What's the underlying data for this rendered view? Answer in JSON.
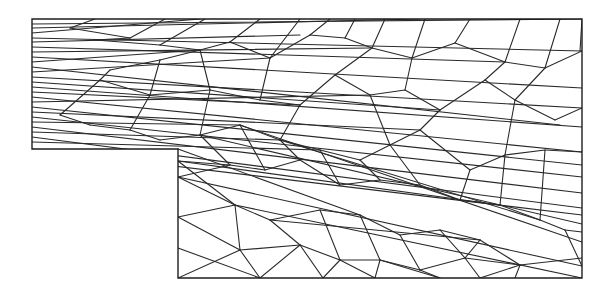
{
  "figure": {
    "title": "Triangular finite element mesh of L-shaped (step) domain",
    "stroke_color": "#2a2a2a",
    "background": "#ffffff"
  },
  "domain_boundary": {
    "points": [
      [
        32,
        19
      ],
      [
        582,
        19
      ],
      [
        582,
        278
      ],
      [
        178,
        278
      ],
      [
        178,
        149
      ],
      [
        32,
        149
      ]
    ]
  },
  "mesh": {
    "nodes_left_edge_y": [
      19,
      24,
      28,
      33,
      38,
      42,
      47,
      52,
      57,
      62,
      67,
      72,
      77,
      82,
      87,
      92,
      97,
      102,
      107,
      112,
      117,
      122,
      127,
      132,
      137,
      142,
      149
    ],
    "nodes_right_edge_y": [
      19,
      51,
      88,
      108,
      127,
      152,
      165,
      177,
      185,
      193,
      200,
      208,
      215,
      224,
      232,
      242,
      258,
      266,
      278
    ],
    "nodes_step_edge_y": [
      149,
      161,
      177,
      217,
      248,
      278
    ],
    "nodes_top_edge_x": [
      32,
      95,
      165,
      205,
      260,
      300,
      330,
      355,
      385,
      425,
      470,
      520,
      560,
      582
    ],
    "nodes_bottom_edge_x": [
      178,
      260,
      323,
      375,
      440,
      480,
      515,
      582
    ],
    "interior_nodes": [
      [
        70,
        28
      ],
      [
        95,
        40
      ],
      [
        130,
        38
      ],
      [
        160,
        45
      ],
      [
        110,
        70
      ],
      [
        160,
        60
      ],
      [
        200,
        50
      ],
      [
        230,
        42
      ],
      [
        270,
        58
      ],
      [
        310,
        35
      ],
      [
        345,
        38
      ],
      [
        372,
        48
      ],
      [
        412,
        58
      ],
      [
        455,
        43
      ],
      [
        505,
        62
      ],
      [
        545,
        68
      ],
      [
        100,
        80
      ],
      [
        150,
        95
      ],
      [
        210,
        90
      ],
      [
        260,
        100
      ],
      [
        300,
        105
      ],
      [
        335,
        75
      ],
      [
        370,
        95
      ],
      [
        405,
        90
      ],
      [
        440,
        110
      ],
      [
        485,
        80
      ],
      [
        515,
        100
      ],
      [
        555,
        120
      ],
      [
        60,
        115
      ],
      [
        90,
        125
      ],
      [
        130,
        130
      ],
      [
        160,
        140
      ],
      [
        200,
        135
      ],
      [
        240,
        125
      ],
      [
        280,
        140
      ],
      [
        320,
        150
      ],
      [
        360,
        160
      ],
      [
        390,
        145
      ],
      [
        420,
        130
      ],
      [
        470,
        170
      ],
      [
        505,
        155
      ],
      [
        545,
        150
      ],
      [
        230,
        165
      ],
      [
        265,
        170
      ],
      [
        300,
        160
      ],
      [
        340,
        185
      ],
      [
        380,
        180
      ],
      [
        420,
        185
      ],
      [
        460,
        200
      ],
      [
        500,
        205
      ],
      [
        540,
        220
      ],
      [
        565,
        230
      ],
      [
        235,
        205
      ],
      [
        270,
        220
      ],
      [
        320,
        210
      ],
      [
        360,
        215
      ],
      [
        400,
        235
      ],
      [
        440,
        230
      ],
      [
        480,
        240
      ],
      [
        520,
        265
      ],
      [
        240,
        250
      ],
      [
        300,
        245
      ],
      [
        340,
        260
      ],
      [
        380,
        260
      ],
      [
        420,
        270
      ],
      [
        465,
        258
      ]
    ],
    "edges": [
      [
        32,
        24,
        582,
        19
      ],
      [
        32,
        28,
        420,
        19
      ],
      [
        32,
        33,
        200,
        19
      ],
      [
        32,
        38,
        582,
        51
      ],
      [
        32,
        42,
        300,
        35
      ],
      [
        32,
        47,
        505,
        62
      ],
      [
        32,
        52,
        370,
        48
      ],
      [
        32,
        57,
        582,
        88
      ],
      [
        32,
        62,
        200,
        50
      ],
      [
        32,
        67,
        560,
        125
      ],
      [
        32,
        72,
        270,
        58
      ],
      [
        32,
        77,
        582,
        108
      ],
      [
        32,
        82,
        440,
        110
      ],
      [
        32,
        87,
        582,
        127
      ],
      [
        32,
        92,
        300,
        105
      ],
      [
        32,
        97,
        582,
        152
      ],
      [
        32,
        102,
        370,
        95
      ],
      [
        32,
        107,
        582,
        165
      ],
      [
        32,
        112,
        420,
        130
      ],
      [
        32,
        117,
        582,
        177
      ],
      [
        32,
        122,
        240,
        125
      ],
      [
        32,
        127,
        582,
        193
      ],
      [
        32,
        132,
        280,
        140
      ],
      [
        32,
        137,
        582,
        208
      ],
      [
        32,
        142,
        320,
        150
      ],
      [
        32,
        149,
        582,
        215
      ],
      [
        95,
        19,
        70,
        28
      ],
      [
        70,
        28,
        130,
        38
      ],
      [
        130,
        38,
        165,
        19
      ],
      [
        130,
        38,
        95,
        40
      ],
      [
        95,
        40,
        160,
        45
      ],
      [
        160,
        45,
        205,
        19
      ],
      [
        160,
        45,
        200,
        50
      ],
      [
        200,
        50,
        230,
        42
      ],
      [
        230,
        42,
        260,
        19
      ],
      [
        230,
        42,
        270,
        58
      ],
      [
        270,
        58,
        300,
        19
      ],
      [
        270,
        58,
        310,
        35
      ],
      [
        310,
        35,
        330,
        19
      ],
      [
        310,
        35,
        345,
        38
      ],
      [
        345,
        38,
        355,
        19
      ],
      [
        345,
        38,
        372,
        48
      ],
      [
        372,
        48,
        385,
        19
      ],
      [
        372,
        48,
        412,
        58
      ],
      [
        412,
        58,
        425,
        19
      ],
      [
        412,
        58,
        455,
        43
      ],
      [
        455,
        43,
        470,
        19
      ],
      [
        455,
        43,
        505,
        62
      ],
      [
        505,
        62,
        520,
        19
      ],
      [
        505,
        62,
        545,
        68
      ],
      [
        545,
        68,
        560,
        19
      ],
      [
        545,
        68,
        582,
        51
      ],
      [
        582,
        19,
        580,
        51
      ],
      [
        110,
        70,
        160,
        60
      ],
      [
        160,
        60,
        200,
        50
      ],
      [
        110,
        70,
        100,
        80
      ],
      [
        100,
        80,
        150,
        95
      ],
      [
        150,
        95,
        210,
        90
      ],
      [
        210,
        90,
        260,
        100
      ],
      [
        260,
        100,
        300,
        105
      ],
      [
        300,
        105,
        335,
        75
      ],
      [
        335,
        75,
        372,
        48
      ],
      [
        335,
        75,
        370,
        95
      ],
      [
        370,
        95,
        405,
        90
      ],
      [
        405,
        90,
        412,
        58
      ],
      [
        405,
        90,
        440,
        110
      ],
      [
        440,
        110,
        485,
        80
      ],
      [
        485,
        80,
        505,
        62
      ],
      [
        485,
        80,
        515,
        100
      ],
      [
        515,
        100,
        555,
        120
      ],
      [
        555,
        120,
        582,
        108
      ],
      [
        515,
        100,
        545,
        68
      ],
      [
        210,
        90,
        200,
        50
      ],
      [
        260,
        100,
        270,
        58
      ],
      [
        150,
        95,
        160,
        60
      ],
      [
        60,
        115,
        90,
        125
      ],
      [
        90,
        125,
        130,
        130
      ],
      [
        130,
        130,
        160,
        140
      ],
      [
        160,
        140,
        200,
        135
      ],
      [
        200,
        135,
        240,
        125
      ],
      [
        240,
        125,
        280,
        140
      ],
      [
        280,
        140,
        320,
        150
      ],
      [
        320,
        150,
        360,
        160
      ],
      [
        360,
        160,
        390,
        145
      ],
      [
        390,
        145,
        420,
        130
      ],
      [
        420,
        130,
        440,
        110
      ],
      [
        420,
        130,
        470,
        170
      ],
      [
        470,
        170,
        505,
        155
      ],
      [
        505,
        155,
        545,
        150
      ],
      [
        545,
        150,
        582,
        152
      ],
      [
        505,
        155,
        515,
        100
      ],
      [
        390,
        145,
        370,
        95
      ],
      [
        280,
        140,
        300,
        105
      ],
      [
        200,
        135,
        210,
        90
      ],
      [
        130,
        130,
        150,
        95
      ],
      [
        60,
        115,
        100,
        80
      ],
      [
        178,
        161,
        230,
        165
      ],
      [
        230,
        165,
        265,
        170
      ],
      [
        265,
        170,
        300,
        160
      ],
      [
        300,
        160,
        340,
        185
      ],
      [
        340,
        185,
        380,
        180
      ],
      [
        380,
        180,
        420,
        185
      ],
      [
        420,
        185,
        460,
        200
      ],
      [
        460,
        200,
        500,
        205
      ],
      [
        500,
        205,
        540,
        220
      ],
      [
        540,
        220,
        565,
        230
      ],
      [
        565,
        230,
        582,
        232
      ],
      [
        178,
        177,
        235,
        205
      ],
      [
        235,
        205,
        270,
        220
      ],
      [
        270,
        220,
        320,
        210
      ],
      [
        320,
        210,
        360,
        215
      ],
      [
        360,
        215,
        400,
        235
      ],
      [
        400,
        235,
        440,
        230
      ],
      [
        440,
        230,
        480,
        240
      ],
      [
        480,
        240,
        520,
        265
      ],
      [
        520,
        265,
        582,
        258
      ],
      [
        178,
        217,
        240,
        250
      ],
      [
        240,
        250,
        300,
        245
      ],
      [
        300,
        245,
        340,
        260
      ],
      [
        340,
        260,
        380,
        260
      ],
      [
        380,
        260,
        420,
        270
      ],
      [
        420,
        270,
        465,
        258
      ],
      [
        465,
        258,
        520,
        265
      ],
      [
        178,
        248,
        260,
        278
      ],
      [
        178,
        278,
        240,
        250
      ],
      [
        240,
        250,
        260,
        278
      ],
      [
        260,
        278,
        300,
        245
      ],
      [
        300,
        245,
        323,
        278
      ],
      [
        323,
        278,
        340,
        260
      ],
      [
        340,
        260,
        375,
        278
      ],
      [
        375,
        278,
        380,
        260
      ],
      [
        380,
        260,
        440,
        278
      ],
      [
        440,
        278,
        420,
        270
      ],
      [
        465,
        258,
        480,
        278
      ],
      [
        480,
        278,
        520,
        265
      ],
      [
        520,
        265,
        515,
        278
      ],
      [
        178,
        161,
        235,
        205
      ],
      [
        235,
        205,
        240,
        250
      ],
      [
        178,
        217,
        235,
        205
      ],
      [
        178,
        177,
        230,
        165
      ],
      [
        230,
        165,
        200,
        135
      ],
      [
        265,
        170,
        240,
        125
      ],
      [
        300,
        160,
        280,
        140
      ],
      [
        340,
        185,
        320,
        150
      ],
      [
        380,
        180,
        360,
        160
      ],
      [
        420,
        185,
        390,
        145
      ],
      [
        460,
        200,
        470,
        170
      ],
      [
        500,
        205,
        505,
        155
      ],
      [
        540,
        220,
        545,
        150
      ],
      [
        270,
        220,
        300,
        245
      ],
      [
        320,
        210,
        340,
        260
      ],
      [
        360,
        215,
        380,
        260
      ],
      [
        400,
        235,
        420,
        270
      ],
      [
        440,
        230,
        465,
        258
      ],
      [
        480,
        240,
        465,
        258
      ],
      [
        565,
        230,
        582,
        266
      ],
      [
        178,
        149,
        360,
        215
      ],
      [
        178,
        161,
        500,
        205
      ],
      [
        200,
        135,
        582,
        224
      ],
      [
        240,
        125,
        582,
        242
      ],
      [
        280,
        140,
        540,
        220
      ],
      [
        178,
        177,
        582,
        266
      ],
      [
        235,
        205,
        582,
        278
      ],
      [
        270,
        220,
        480,
        240
      ]
    ]
  }
}
